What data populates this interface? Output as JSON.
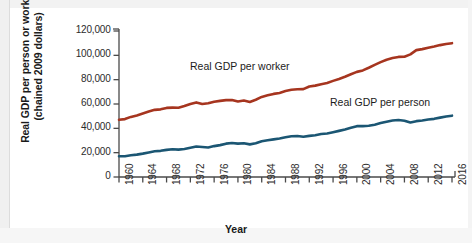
{
  "chart_data": {
    "type": "line",
    "title": "",
    "xlabel": "Year",
    "ylabel": "Real GDP per person or worker (chained 2009 dollars)",
    "ylabel_line1": "Real GDP per person or worker",
    "ylabel_line2": "(chained 2009 dollars)",
    "xlim": [
      1960,
      2016
    ],
    "ylim": [
      0,
      120000
    ],
    "grid": false,
    "legend_position": "inline-annotations",
    "yticks": [
      0,
      20000,
      40000,
      60000,
      80000,
      100000,
      120000
    ],
    "ytick_labels": [
      "0",
      "20,000",
      "40,000",
      "60,000",
      "80,000",
      "100,000",
      "120,000"
    ],
    "xticks": [
      1960,
      1964,
      1968,
      1972,
      1976,
      1980,
      1984,
      1988,
      1992,
      1996,
      2000,
      2004,
      2008,
      2012,
      2016
    ],
    "xtick_labels": [
      "1960",
      "1964",
      "1968",
      "1972",
      "1976",
      "1980",
      "1984",
      "1988",
      "1992",
      "1996",
      "2000",
      "2004",
      "2008",
      "2012",
      "2016"
    ],
    "x": [
      1960,
      1961,
      1962,
      1963,
      1964,
      1965,
      1966,
      1967,
      1968,
      1969,
      1970,
      1971,
      1972,
      1973,
      1974,
      1975,
      1976,
      1977,
      1978,
      1979,
      1980,
      1981,
      1982,
      1983,
      1984,
      1985,
      1986,
      1987,
      1988,
      1989,
      1990,
      1991,
      1992,
      1993,
      1994,
      1995,
      1996,
      1997,
      1998,
      1999,
      2000,
      2001,
      2002,
      2003,
      2004,
      2005,
      2006,
      2007,
      2008,
      2009,
      2010,
      2011,
      2012,
      2013,
      2014,
      2015,
      2016
    ],
    "series": [
      {
        "name": "Real GDP per worker",
        "color": "#a6351f",
        "annotation": "Real GDP per worker",
        "values": [
          47000,
          47600,
          49400,
          50600,
          52200,
          53800,
          55200,
          55600,
          56800,
          57000,
          56900,
          58300,
          60000,
          61300,
          60000,
          60600,
          61900,
          62600,
          63200,
          63300,
          62000,
          62900,
          61700,
          63500,
          65800,
          67100,
          68300,
          69100,
          70600,
          71700,
          72100,
          72200,
          74400,
          75100,
          76300,
          77200,
          79000,
          80600,
          82400,
          84400,
          86400,
          87600,
          89800,
          92200,
          94400,
          96400,
          97800,
          98700,
          98800,
          100800,
          104300,
          105100,
          106200,
          107200,
          108400,
          109300,
          110000
        ]
      },
      {
        "name": "Real GDP per person",
        "color": "#1b5673",
        "annotation": "Real GDP per person",
        "values": [
          17000,
          17100,
          17900,
          18400,
          19200,
          20200,
          21200,
          21500,
          22300,
          22800,
          22500,
          23000,
          24000,
          25100,
          24700,
          24300,
          25400,
          26200,
          27400,
          27900,
          27400,
          27800,
          26800,
          27700,
          29400,
          30200,
          30900,
          31700,
          32700,
          33500,
          33700,
          33100,
          33800,
          34300,
          35300,
          35800,
          36800,
          37900,
          39100,
          40500,
          41800,
          41800,
          42100,
          43000,
          44300,
          45400,
          46400,
          46800,
          46300,
          44800,
          45900,
          46400,
          47200,
          47800,
          48800,
          49700,
          50400
        ]
      }
    ]
  },
  "axis": {
    "x_label": "Year"
  },
  "annotations": [
    {
      "name": "worker-series-label",
      "text": "Real GDP per worker"
    },
    {
      "name": "person-series-label",
      "text": "Real GDP per person"
    }
  ]
}
